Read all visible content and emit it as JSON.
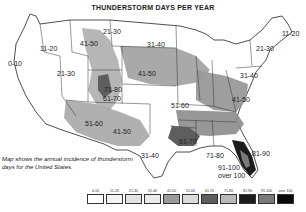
{
  "title": "THUNDERSTORM DAYS PER YEAR",
  "caption": "Map shows the annual incidence of thunderstorm days for the United States.",
  "map_labels": [
    {
      "id": "pacific-coast",
      "text": "0-10",
      "x": 8,
      "y": 60
    },
    {
      "id": "pacific-northwest",
      "text": "11-20",
      "x": 40,
      "y": 45
    },
    {
      "id": "great-basin",
      "text": "21-30",
      "x": 57,
      "y": 70
    },
    {
      "id": "montana-west",
      "text": "41-50",
      "x": 80,
      "y": 40
    },
    {
      "id": "montana-east",
      "text": "21-30",
      "x": 103,
      "y": 28
    },
    {
      "id": "dakotas",
      "text": "31-40",
      "x": 147,
      "y": 41
    },
    {
      "id": "nebraska",
      "text": "41-50",
      "x": 138,
      "y": 70
    },
    {
      "id": "colorado-rockies",
      "text": "71-80",
      "x": 104,
      "y": 86
    },
    {
      "id": "colorado-south",
      "text": "61-70",
      "x": 103,
      "y": 95
    },
    {
      "id": "arizona",
      "text": "51-60",
      "x": 85,
      "y": 120
    },
    {
      "id": "new-mexico",
      "text": "41-50",
      "x": 113,
      "y": 128
    },
    {
      "id": "west-texas",
      "text": "31-40",
      "x": 141,
      "y": 152
    },
    {
      "id": "kansas-missouri",
      "text": "51-60",
      "x": 171,
      "y": 102
    },
    {
      "id": "virginia",
      "text": "41-50",
      "x": 232,
      "y": 96
    },
    {
      "id": "pennsylvania",
      "text": "31-40",
      "x": 240,
      "y": 72
    },
    {
      "id": "new-york",
      "text": "21-30",
      "x": 256,
      "y": 45
    },
    {
      "id": "maine",
      "text": "11-20",
      "x": 282,
      "y": 30
    },
    {
      "id": "louisiana",
      "text": "61-70",
      "x": 179,
      "y": 138
    },
    {
      "id": "gulf-coast",
      "text": "71-80",
      "x": 206,
      "y": 152
    },
    {
      "id": "north-florida",
      "text": "81-90",
      "x": 252,
      "y": 150
    },
    {
      "id": "central-florida",
      "text": "91-100",
      "x": 218,
      "y": 164
    },
    {
      "id": "south-florida",
      "text": "over 100",
      "x": 218,
      "y": 172
    }
  ],
  "legend": [
    {
      "label": "0-10",
      "color": "#ffffff"
    },
    {
      "label": "11-20",
      "color": "#f4f4f4"
    },
    {
      "label": "21-30",
      "color": "#e2e2e2"
    },
    {
      "label": "31-40",
      "color": "#ebebeb"
    },
    {
      "label": "41-50",
      "color": "#9a9a9a"
    },
    {
      "label": "51-60",
      "color": "#dcdcdc"
    },
    {
      "label": "61-70",
      "color": "#5e5e5e"
    },
    {
      "label": "71-80",
      "color": "#b9b9b9"
    },
    {
      "label": "81-90",
      "color": "#1c1c1c"
    },
    {
      "label": "91-100",
      "color": "#7a7a7a"
    },
    {
      "label": "over 100",
      "color": "#0a0a0a"
    }
  ]
}
